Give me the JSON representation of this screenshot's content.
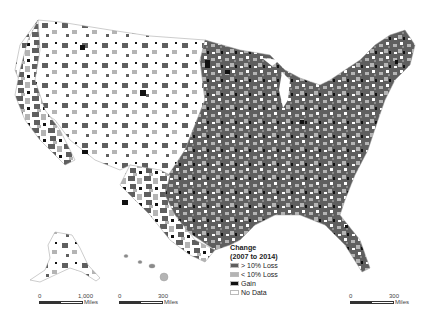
{
  "map": {
    "subject": "United States counties",
    "colors": {
      "greater_10_loss": "#5f5f5f",
      "less_10_loss": "#b4b4b4",
      "gain": "#111111",
      "no_data": "#ffffff",
      "boundary": "#9a9a9a"
    }
  },
  "legend": {
    "title": "Change",
    "subtitle": "(2007 to 2014)",
    "items": [
      {
        "label": "> 10% Loss",
        "color": "#5f5f5f"
      },
      {
        "label": "< 10% Loss",
        "color": "#b4b4b4"
      },
      {
        "label": "Gain",
        "color": "#111111"
      },
      {
        "label": "No Data",
        "color": "#ffffff"
      }
    ]
  },
  "scalebars": [
    {
      "id": "alaska",
      "start": "0",
      "end": "1,000",
      "unit": "Miles"
    },
    {
      "id": "hawaii",
      "start": "0",
      "end": "300",
      "unit": "Miles"
    },
    {
      "id": "conus",
      "start": "0",
      "end": "300",
      "unit": "Miles"
    }
  ]
}
